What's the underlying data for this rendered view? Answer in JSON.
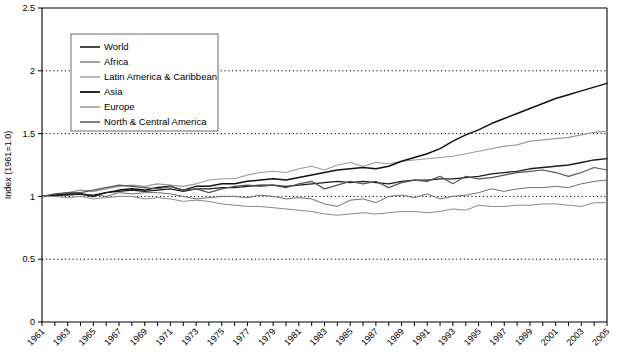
{
  "chart_data": {
    "type": "line",
    "title": "",
    "xlabel": "",
    "ylabel": "Index (1961=1.0)",
    "ylim": [
      0,
      2.5
    ],
    "yticks": [
      0,
      0.5,
      1,
      1.5,
      2,
      2.5
    ],
    "ytick_labels": [
      "0",
      "0.5",
      "1",
      "1.5",
      "2",
      "2.5"
    ],
    "grid": "horizontal dotted at 0.5, 1.0, 1.5, 2.0",
    "legend_position": "upper-left inside plot",
    "x": [
      1961,
      1962,
      1963,
      1964,
      1965,
      1966,
      1967,
      1968,
      1969,
      1970,
      1971,
      1972,
      1973,
      1974,
      1975,
      1976,
      1977,
      1978,
      1979,
      1980,
      1981,
      1982,
      1983,
      1984,
      1985,
      1986,
      1987,
      1988,
      1989,
      1990,
      1991,
      1992,
      1993,
      1994,
      1995,
      1996,
      1997,
      1998,
      1999,
      2000,
      2001,
      2002,
      2003,
      2004,
      2005
    ],
    "xtick_labels": [
      "1961",
      "1963",
      "1965",
      "1967",
      "1969",
      "1971",
      "1973",
      "1975",
      "1977",
      "1979",
      "1981",
      "1983",
      "1985",
      "1987",
      "1989",
      "1991",
      "1993",
      "1995",
      "1997",
      "1999",
      "2001",
      "2003",
      "2005"
    ],
    "series": [
      {
        "name": "World",
        "color": "#1a1a1a",
        "width": 1.3,
        "values": [
          1.0,
          1.01,
          1.01,
          1.02,
          1.01,
          1.03,
          1.04,
          1.05,
          1.04,
          1.05,
          1.06,
          1.04,
          1.06,
          1.06,
          1.07,
          1.07,
          1.08,
          1.09,
          1.09,
          1.08,
          1.09,
          1.1,
          1.11,
          1.12,
          1.11,
          1.12,
          1.11,
          1.1,
          1.12,
          1.13,
          1.13,
          1.14,
          1.14,
          1.15,
          1.16,
          1.18,
          1.19,
          1.2,
          1.22,
          1.23,
          1.24,
          1.25,
          1.27,
          1.29,
          1.3
        ]
      },
      {
        "name": "Africa",
        "color": "#6e6e6e",
        "width": 1.0,
        "values": [
          1.0,
          1.0,
          1.02,
          1.02,
          1.01,
          1.0,
          1.03,
          1.02,
          1.03,
          1.03,
          1.02,
          1.0,
          0.98,
          0.99,
          1.0,
          1.0,
          0.99,
          1.01,
          1.0,
          0.98,
          0.99,
          0.98,
          0.94,
          0.92,
          0.97,
          0.98,
          0.95,
          1.0,
          1.01,
          0.99,
          1.02,
          0.98,
          1.0,
          1.01,
          1.03,
          1.06,
          1.04,
          1.06,
          1.07,
          1.07,
          1.08,
          1.07,
          1.1,
          1.12,
          1.13
        ]
      },
      {
        "name": "Latin America & Caribbean",
        "color": "#9a9a9a",
        "width": 1.1,
        "values": [
          1.0,
          1.01,
          1.03,
          1.05,
          1.04,
          1.06,
          1.08,
          1.09,
          1.08,
          1.1,
          1.09,
          1.08,
          1.1,
          1.13,
          1.14,
          1.14,
          1.17,
          1.19,
          1.2,
          1.19,
          1.22,
          1.24,
          1.21,
          1.25,
          1.27,
          1.24,
          1.27,
          1.26,
          1.28,
          1.29,
          1.3,
          1.31,
          1.32,
          1.34,
          1.36,
          1.38,
          1.4,
          1.41,
          1.44,
          1.45,
          1.46,
          1.47,
          1.49,
          1.51,
          1.52
        ]
      },
      {
        "name": "Asia",
        "color": "#111111",
        "width": 1.5,
        "values": [
          1.0,
          1.01,
          1.02,
          1.02,
          1.0,
          1.03,
          1.05,
          1.06,
          1.05,
          1.07,
          1.08,
          1.05,
          1.08,
          1.08,
          1.1,
          1.1,
          1.12,
          1.13,
          1.14,
          1.13,
          1.15,
          1.17,
          1.19,
          1.21,
          1.22,
          1.23,
          1.22,
          1.24,
          1.28,
          1.31,
          1.34,
          1.38,
          1.44,
          1.49,
          1.53,
          1.58,
          1.62,
          1.66,
          1.7,
          1.74,
          1.78,
          1.81,
          1.84,
          1.87,
          1.9
        ]
      },
      {
        "name": "Europe",
        "color": "#8a8a8a",
        "width": 1.0,
        "values": [
          1.0,
          1.0,
          0.99,
          1.0,
          0.98,
          0.99,
          1.0,
          1.0,
          0.98,
          0.99,
          0.98,
          0.96,
          0.97,
          0.96,
          0.94,
          0.93,
          0.92,
          0.92,
          0.91,
          0.9,
          0.89,
          0.88,
          0.86,
          0.85,
          0.86,
          0.87,
          0.86,
          0.87,
          0.88,
          0.88,
          0.87,
          0.88,
          0.9,
          0.89,
          0.93,
          0.92,
          0.92,
          0.93,
          0.93,
          0.94,
          0.94,
          0.93,
          0.92,
          0.95,
          0.95
        ]
      },
      {
        "name": "North & Central America",
        "color": "#555555",
        "width": 1.2,
        "values": [
          1.0,
          1.02,
          1.03,
          1.03,
          1.05,
          1.07,
          1.09,
          1.08,
          1.07,
          1.06,
          1.08,
          1.05,
          1.06,
          1.03,
          1.06,
          1.08,
          1.09,
          1.08,
          1.09,
          1.07,
          1.1,
          1.12,
          1.06,
          1.09,
          1.12,
          1.1,
          1.12,
          1.07,
          1.11,
          1.13,
          1.12,
          1.16,
          1.1,
          1.16,
          1.14,
          1.15,
          1.17,
          1.19,
          1.2,
          1.21,
          1.19,
          1.16,
          1.19,
          1.23,
          1.21
        ]
      }
    ]
  }
}
